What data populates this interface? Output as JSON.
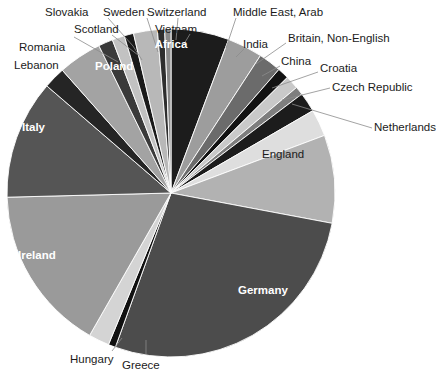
{
  "chart_data": {
    "type": "pie",
    "title": "",
    "subtitle": "",
    "xlabel": "",
    "ylabel": "",
    "legend_position": "none",
    "grid": false,
    "labels_placement": "inside-and-callout",
    "categories": [
      "Germany",
      "Ireland",
      "Italy",
      "England",
      "Poland",
      "Africa",
      "Lebanon",
      "Romania",
      "Scotland",
      "Slovakia",
      "Sweden",
      "Switzerland",
      "Vietnam",
      "Middle East, Arab",
      "India",
      "Britain, Non-English",
      "China",
      "Croatia",
      "Czech Republic",
      "Netherlands",
      "Greece",
      "Hungary"
    ],
    "values": [
      27.0,
      16.0,
      11.5,
      8.5,
      4.2,
      5.6,
      2.1,
      1.4,
      1.2,
      0.9,
      2.3,
      0.7,
      0.6,
      3.4,
      2.2,
      1.1,
      1.3,
      0.8,
      1.9,
      2.6,
      0.7,
      2.0
    ],
    "slices": [
      {
        "name": "Africa",
        "value": 5.6,
        "color": "#1c1c1c",
        "label_mode": "inside",
        "label_color": "#ffffff"
      },
      {
        "name": "Middle East, Arab",
        "value": 3.4,
        "color": "#9d9d9d",
        "label_mode": "callout",
        "label_color": "#1b1b1b"
      },
      {
        "name": "India",
        "value": 2.2,
        "color": "#6b6b6b",
        "label_mode": "callout",
        "label_color": "#1b1b1b"
      },
      {
        "name": "Britain, Non-English",
        "value": 1.1,
        "color": "#121212",
        "label_mode": "callout",
        "label_color": "#1b1b1b"
      },
      {
        "name": "China",
        "value": 1.3,
        "color": "#c9c9c9",
        "label_mode": "callout",
        "label_color": "#1b1b1b"
      },
      {
        "name": "Croatia",
        "value": 0.8,
        "color": "#7e7e7e",
        "label_mode": "callout",
        "label_color": "#1b1b1b"
      },
      {
        "name": "Czech Republic",
        "value": 1.9,
        "color": "#1c1c1c",
        "label_mode": "callout",
        "label_color": "#1b1b1b"
      },
      {
        "name": "Netherlands",
        "value": 2.6,
        "color": "#dedede",
        "label_mode": "callout",
        "label_color": "#1b1b1b"
      },
      {
        "name": "England",
        "value": 8.5,
        "color": "#b2b2b2",
        "label_mode": "inside",
        "label_color": "#1b1b1b"
      },
      {
        "name": "Germany",
        "value": 27.0,
        "color": "#4c4c4c",
        "label_mode": "inside",
        "label_color": "#ffffff"
      },
      {
        "name": "Greece",
        "value": 0.7,
        "color": "#101010",
        "label_mode": "callout",
        "label_color": "#1b1b1b"
      },
      {
        "name": "Hungary",
        "value": 2.0,
        "color": "#d4d4d4",
        "label_mode": "callout",
        "label_color": "#1b1b1b"
      },
      {
        "name": "Ireland",
        "value": 16.0,
        "color": "#9a9a9a",
        "label_mode": "inside",
        "label_color": "#ffffff"
      },
      {
        "name": "Italy",
        "value": 11.5,
        "color": "#555555",
        "label_mode": "inside",
        "label_color": "#ffffff"
      },
      {
        "name": "Lebanon",
        "value": 2.1,
        "color": "#252525",
        "label_mode": "callout",
        "label_color": "#1b1b1b"
      },
      {
        "name": "Poland",
        "value": 4.2,
        "color": "#a3a3a3",
        "label_mode": "inside",
        "label_color": "#ffffff"
      },
      {
        "name": "Romania",
        "value": 1.4,
        "color": "#3a3a3a",
        "label_mode": "callout",
        "label_color": "#1b1b1b"
      },
      {
        "name": "Scotland",
        "value": 1.2,
        "color": "#c2c2c2",
        "label_mode": "callout",
        "label_color": "#1b1b1b"
      },
      {
        "name": "Slovakia",
        "value": 0.9,
        "color": "#1a1a1a",
        "label_mode": "callout",
        "label_color": "#1b1b1b"
      },
      {
        "name": "Sweden",
        "value": 2.3,
        "color": "#b8b8b8",
        "label_mode": "callout",
        "label_color": "#1b1b1b"
      },
      {
        "name": "Switzerland",
        "value": 0.7,
        "color": "#2e2e2e",
        "label_mode": "callout",
        "label_color": "#1b1b1b"
      },
      {
        "name": "Vietnam",
        "value": 0.6,
        "color": "#8a8a8a",
        "label_mode": "callout",
        "label_color": "#1b1b1b"
      }
    ]
  },
  "labels": {
    "slovakia": "Slovakia",
    "sweden": "Sweden",
    "switzerland": "Switzerland",
    "vietnam": "Vietnam",
    "scotland": "Scotland",
    "romania": "Romania",
    "lebanon": "Lebanon",
    "poland": "Poland",
    "italy": "Italy",
    "ireland": "Ireland",
    "africa": "Africa",
    "middle_east_arab": "Middle East, Arab",
    "india": "India",
    "britain_non_english": "Britain, Non-English",
    "china": "China",
    "croatia": "Croatia",
    "czech_republic": "Czech Republic",
    "netherlands": "Netherlands",
    "england": "England",
    "germany": "Germany",
    "hungary": "Hungary",
    "greece": "Greece"
  },
  "geometry": {
    "center_x": 171,
    "center_y": 193,
    "radius": 164
  },
  "colors": {
    "background": "#ffffff",
    "slice_border": "#ffffff",
    "leader_line": "#8c8c8c",
    "text_dark": "#1b1b1b",
    "text_light": "#ffffff"
  }
}
